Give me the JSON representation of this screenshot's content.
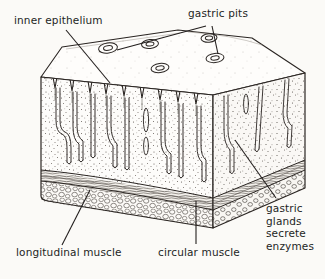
{
  "figure": {
    "background_color": "#fbfaf7",
    "ink_color": "#231f1e"
  },
  "labels": {
    "inner_epithelium": "inner epithelium",
    "gastric_pits": "gastric pits",
    "longitudinal_muscle": "longitudinal muscle",
    "circular_muscle": "circular muscle",
    "gastric_glands_line1": "gastric",
    "gastric_glands_line2": "glands",
    "gastric_glands_line3": "secrete",
    "gastric_glands_line4": "enzymes"
  },
  "diagram": {
    "layers": [
      {
        "name": "mucosa-with-gastric-glands",
        "fill": "stippled"
      },
      {
        "name": "circular-muscle-band",
        "fill": "wavy-hatched"
      },
      {
        "name": "longitudinal-muscle-band",
        "fill": "cobbled-bubbles"
      }
    ],
    "top_face_pits": 5,
    "front_face_glands": 7
  }
}
